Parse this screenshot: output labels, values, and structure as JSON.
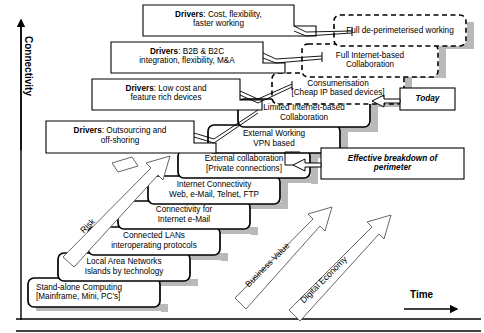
{
  "diagram": {
    "axes": {
      "y_label": "Connectivity",
      "x_label": "Time"
    },
    "colors": {
      "ink": "#000000",
      "shadow": "#b3b3b3",
      "paper": "#ffffff"
    },
    "steps": [
      {
        "id": "stand-alone-computing",
        "line1": "Stand-alone Computing",
        "line2": "[Mainframe, Mini, PC's]",
        "align": "left",
        "style": "solid",
        "x": 28,
        "y": 278,
        "w": 132,
        "h": 29
      },
      {
        "id": "local-area-networks",
        "line1": "Local Area Networks",
        "line2": "Islands by technology",
        "align": "center",
        "style": "solid",
        "x": 58,
        "y": 253,
        "w": 132,
        "h": 28
      },
      {
        "id": "connected-lans",
        "line1": "Connected LANs",
        "line2": "interoperating protocols",
        "align": "center",
        "style": "solid",
        "x": 88,
        "y": 227,
        "w": 132,
        "h": 28
      },
      {
        "id": "connectivity-internet-email",
        "line1": "Connectivity for",
        "line2": "Internet e-Mail",
        "align": "center",
        "style": "solid",
        "x": 118,
        "y": 201,
        "w": 132,
        "h": 28
      },
      {
        "id": "internet-connectivity",
        "line1": "Internet Connectivity",
        "line2": "Web, e-Mail, Telnet, FTP",
        "align": "center",
        "style": "solid",
        "x": 148,
        "y": 176,
        "w": 132,
        "h": 28
      },
      {
        "id": "external-collaboration",
        "line1": "External collaboration",
        "line2": "[Private connections]",
        "align": "center",
        "style": "solid",
        "x": 178,
        "y": 150,
        "w": 132,
        "h": 28
      },
      {
        "id": "external-working-vpn",
        "line1": "External Working",
        "line2": "VPN based",
        "align": "center",
        "style": "solid",
        "x": 208,
        "y": 125,
        "w": 132,
        "h": 28
      },
      {
        "id": "limited-internet-collaboration",
        "line1": "Limited Internet-based",
        "line2": "Collaboration",
        "align": "center",
        "style": "solid",
        "x": 238,
        "y": 99,
        "w": 132,
        "h": 28
      },
      {
        "id": "consumerisation",
        "line1": "Consumerisation",
        "line2": "[Cheap IP based devices]",
        "align": "center",
        "style": "dashed",
        "x": 272,
        "y": 73,
        "w": 132,
        "h": 31
      },
      {
        "id": "full-internet-collaboration",
        "line1": "Full Internet-based",
        "line2": "Collaboration",
        "align": "center",
        "style": "dashed",
        "x": 302,
        "y": 44,
        "w": 136,
        "h": 33
      },
      {
        "id": "full-de-perimeterised-working",
        "line1": "Full de-perimeterised working",
        "line2": "",
        "align": "center",
        "style": "dashed",
        "x": 334,
        "y": 15,
        "w": 132,
        "h": 31
      }
    ],
    "driver_callouts": [
      {
        "id": "drivers-outsourcing",
        "prefix": "Drivers",
        "line1": ": Outsourcing and",
        "line2": "off-shoring",
        "x": 46,
        "y": 121,
        "w": 148,
        "h": 32
      },
      {
        "id": "drivers-low-cost",
        "prefix": "Drivers",
        "line1": ": Low cost and",
        "line2": "feature rich devices",
        "x": 92,
        "y": 79,
        "w": 148,
        "h": 31
      },
      {
        "id": "drivers-b2b-b2c",
        "prefix": "Drivers",
        "line1": ": B2B & B2C",
        "line2": "integration, flexibility, M&A",
        "x": 111,
        "y": 42,
        "w": 152,
        "h": 31
      },
      {
        "id": "drivers-cost-flexibility",
        "prefix": "Drivers",
        "line1": ": Cost, flexibility,",
        "line2": "faster working",
        "x": 143,
        "y": 5,
        "w": 151,
        "h": 31
      }
    ],
    "annotations": [
      {
        "id": "today",
        "line1": "Today",
        "line2": "",
        "x": 400,
        "y": 88,
        "w": 55,
        "h": 22
      },
      {
        "id": "effective-breakdown-of-perimeter",
        "line1": "Effective breakdown of",
        "line2": "perimeter",
        "x": 321,
        "y": 148,
        "w": 143,
        "h": 31
      }
    ],
    "trend_arrows": [
      {
        "id": "risk-arrow",
        "label": "Risk",
        "angle": -45
      },
      {
        "id": "business-value-arrow",
        "label": "Business Value",
        "angle": -45
      },
      {
        "id": "digital-economy-arrow",
        "label": "Digital Economy",
        "angle": -45
      }
    ]
  }
}
